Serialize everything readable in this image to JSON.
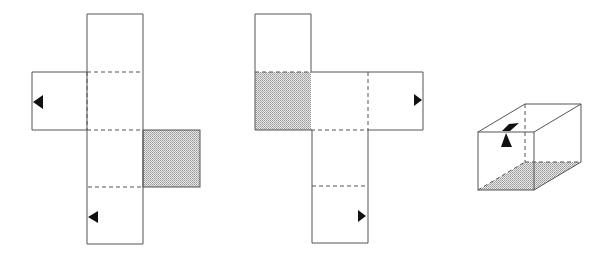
{
  "figure": {
    "colors": {
      "line": "#555555",
      "shade": "#c8c8c8",
      "marker": "#111111",
      "background": "#ffffff"
    },
    "nets": [
      {
        "id": "net-1",
        "shaded_face": "right-flap",
        "markers": [
          "left-arrow on left flap",
          "left-arrow on bottom square"
        ]
      },
      {
        "id": "net-2",
        "shaded_face": "left-middle",
        "markers": [
          "right-arrow on right flap",
          "right-arrow on bottom square"
        ]
      }
    ],
    "box": {
      "id": "box-3d",
      "shaded_face": "bottom",
      "markers": [
        "arrow on front-top edge"
      ]
    }
  }
}
